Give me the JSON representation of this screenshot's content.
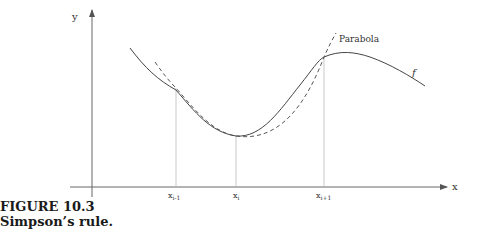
{
  "figure": {
    "caption_number": "FIGURE 10.3",
    "caption_text": "Simpson’s rule."
  },
  "axes": {
    "x_label": "x",
    "y_label": "y"
  },
  "ticks": [
    {
      "label": "x",
      "sub": "i-1"
    },
    {
      "label": "x",
      "sub": "i"
    },
    {
      "label": "x",
      "sub": "i+1"
    }
  ],
  "curves": {
    "function_label": "f",
    "parabola_label": "Parabola"
  },
  "colors": {
    "axis": "#555555",
    "curve": "#444444",
    "guide": "#bbbbbb"
  }
}
